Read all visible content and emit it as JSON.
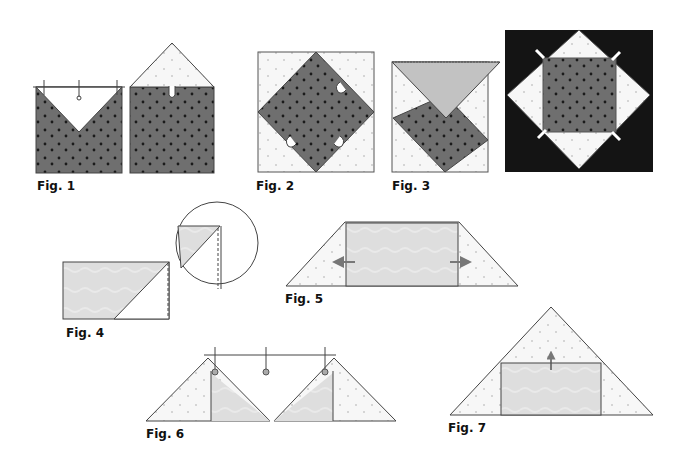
{
  "colors": {
    "dark_fabric": "#6f6f6f",
    "dark_dot": "#1a1a1a",
    "light_fabric": "#f7f7f7",
    "light_dot": "#9a9a9a",
    "medium_fabric": "#dcdcdc",
    "triangle_fabric": "#c2c2c2",
    "background_block": "#141414",
    "stroke": "#333333",
    "arrow": "#8a8a8a"
  },
  "figures": [
    {
      "id": "fig1",
      "label": "Fig. 1",
      "description": "Square with V-shaped light triangle pinned on top; second square with light triangle sewn above"
    },
    {
      "id": "fig2",
      "label": "Fig. 2",
      "description": "Dark square on point inside light square, clipped corners"
    },
    {
      "id": "fig3",
      "label": "Fig. 3",
      "description": "Medium triangle folded down over dark square on point"
    },
    {
      "id": "fig4",
      "label": "Fig. 4",
      "description": "Rectangle with diagonal seam and circular detail callout"
    },
    {
      "id": "fig5",
      "label": "Fig. 5",
      "description": "Trapezoid unit with pressing arrows outward"
    },
    {
      "id": "fig6",
      "label": "Fig. 6",
      "description": "Two triangle units pinned to long strip"
    },
    {
      "id": "fig7",
      "label": "Fig. 7",
      "description": "Large triangle sewn to rectangle unit with pressing arrow up"
    }
  ]
}
